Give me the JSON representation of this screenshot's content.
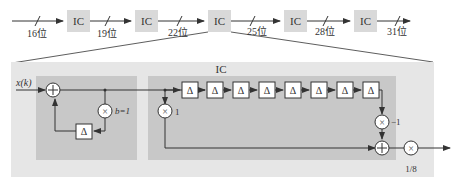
{
  "chain": {
    "blocks": [
      "IC",
      "IC",
      "IC",
      "IC",
      "IC"
    ],
    "bit_widths": [
      "16位",
      "19位",
      "22位",
      "25位",
      "28位",
      "31位"
    ]
  },
  "detail": {
    "input_label": "x(k)",
    "ic_title": "IC",
    "integrator_gain": "b=1",
    "tap_gain": "1",
    "comb_gain": "−1",
    "output_scale": "1/8",
    "delay_symbol": "Δ",
    "delay_count_comb": 8
  },
  "colors": {
    "ic_block": "#d9d9d9",
    "outer_panel": "#e6e6e6",
    "inner_panel": "#c8c8c8",
    "line": "#333333"
  }
}
